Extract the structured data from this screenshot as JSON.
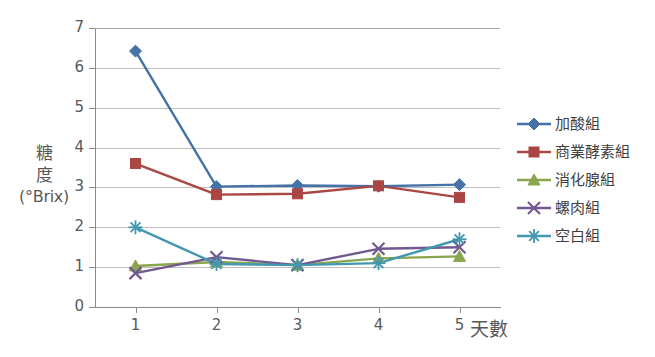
{
  "chart_data": {
    "type": "line",
    "title": "",
    "xlabel": "天數",
    "ylabel": "糖度(°Brix)",
    "ylabel_lines": [
      "糖",
      "度",
      "(°Brix)"
    ],
    "categories": [
      "1",
      "2",
      "3",
      "4",
      "5"
    ],
    "x": [
      1,
      2,
      3,
      4,
      5
    ],
    "xlim": [
      0.5,
      5.5
    ],
    "ylim": [
      0,
      7
    ],
    "yticks": [
      "0",
      "1",
      "2",
      "3",
      "4",
      "5",
      "6",
      "7"
    ],
    "grid": true,
    "legend_position": "right",
    "series": [
      {
        "name": "加酸組",
        "color": "#4572A7",
        "marker": "diamond",
        "values": [
          6.42,
          3.02,
          3.05,
          3.03,
          3.07
        ]
      },
      {
        "name": "商業酵素組",
        "color": "#AA4643",
        "marker": "square",
        "values": [
          3.6,
          2.82,
          2.84,
          3.04,
          2.75
        ]
      },
      {
        "name": "消化腺組",
        "color": "#89A54E",
        "marker": "triangle",
        "values": [
          1.03,
          1.13,
          1.05,
          1.22,
          1.27
        ]
      },
      {
        "name": "螺肉組",
        "color": "#71588F",
        "marker": "x",
        "values": [
          0.85,
          1.25,
          1.05,
          1.46,
          1.5
        ]
      },
      {
        "name": "空白組",
        "color": "#4198AF",
        "marker": "asterisk",
        "values": [
          2.0,
          1.08,
          1.05,
          1.1,
          1.7
        ]
      }
    ]
  },
  "legend": {
    "items": [
      {
        "label": "加酸組",
        "color": "#4572A7",
        "marker": "diamond"
      },
      {
        "label": "商業酵素組",
        "color": "#AA4643",
        "marker": "square"
      },
      {
        "label": "消化腺組",
        "color": "#89A54E",
        "marker": "triangle"
      },
      {
        "label": "螺肉組",
        "color": "#71588F",
        "marker": "x"
      },
      {
        "label": "空白組",
        "color": "#4198AF",
        "marker": "asterisk"
      }
    ]
  },
  "colors": {
    "gridline": "#bfbfbf",
    "axis": "#8c8c8c",
    "text": "#595959",
    "background": "#ffffff"
  }
}
